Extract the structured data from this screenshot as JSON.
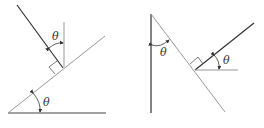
{
  "diagrams": [
    {
      "name": "incline-left",
      "angle_labels": [
        "θ",
        "θ"
      ],
      "description": "Incline at angle θ with horizontal; perpendicular to incline makes angle θ with vertical"
    },
    {
      "name": "incline-right",
      "angle_labels": [
        "θ",
        "θ"
      ],
      "description": "Line at angle θ from vertical; perpendicular to it makes angle θ with horizontal"
    }
  ],
  "colors": {
    "dark_line": "#333333",
    "light_line": "#888888"
  }
}
